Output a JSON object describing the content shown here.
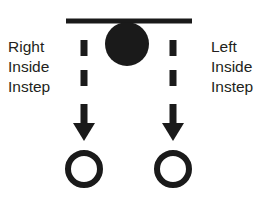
{
  "diagram": {
    "background_color": "#ffffff",
    "ink_color": "#1a1a1a",
    "text_color": "#231f20",
    "width": 277,
    "height": 217
  },
  "labels": {
    "left": {
      "name": "right-inside-instep-label",
      "line1": "Right",
      "line2": "Inside",
      "line3": "Instep"
    },
    "right": {
      "name": "left-inside-instep-label",
      "line1": "Left",
      "line2": "Inside",
      "line3": "Instep"
    }
  },
  "shapes": {
    "start_bar": {
      "name": "start-line-bar",
      "x1": 66,
      "y1": 21,
      "x2": 192,
      "y2": 21,
      "thickness": 5
    },
    "ball": {
      "name": "ball-marker",
      "cx": 127,
      "cy": 44,
      "r": 22,
      "filled": true
    },
    "paths": [
      {
        "name": "left-dashed-path",
        "x": 84,
        "dashes": [
          {
            "y_top": 40,
            "y_bottom": 56
          },
          {
            "y_top": 70,
            "y_bottom": 86
          }
        ],
        "arrow": {
          "name": "left-arrow-icon",
          "shaft_top": 104,
          "shaft_bottom": 124,
          "shaft_width": 7,
          "head_half_width": 11,
          "tip_y": 141
        },
        "cone": {
          "name": "left-cone-marker",
          "cx": 84,
          "cy": 169,
          "r": 16,
          "stroke": 6
        }
      },
      {
        "name": "right-dashed-path",
        "x": 173,
        "dashes": [
          {
            "y_top": 40,
            "y_bottom": 56
          },
          {
            "y_top": 70,
            "y_bottom": 86
          }
        ],
        "arrow": {
          "name": "right-arrow-icon",
          "shaft_top": 104,
          "shaft_bottom": 124,
          "shaft_width": 7,
          "head_half_width": 11,
          "tip_y": 141
        },
        "cone": {
          "name": "right-cone-marker",
          "cx": 173,
          "cy": 169,
          "r": 16,
          "stroke": 6
        }
      }
    ]
  }
}
